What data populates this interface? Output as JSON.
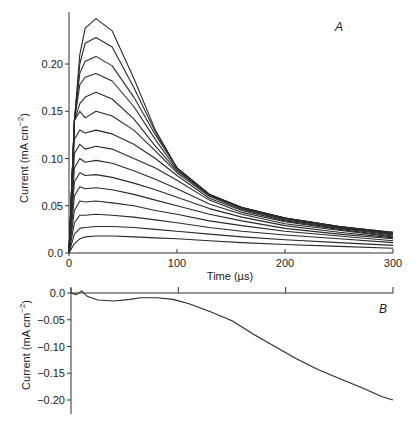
{
  "chart_data": [
    {
      "panel": "A",
      "type": "line",
      "xlabel": "Time (µs)",
      "ylabel": "Current (mA cm⁻²)",
      "xlim": [
        0,
        300
      ],
      "ylim": [
        0,
        0.25
      ],
      "xticks": [
        0,
        100,
        200,
        300
      ],
      "yticks": [
        0.0,
        0.05,
        0.1,
        0.15,
        0.2
      ],
      "ytick_labels": [
        "0.0",
        "0.05",
        "0.10",
        "0.15",
        "0.20"
      ],
      "xtick_labels": [
        "0",
        "100",
        "200",
        "300"
      ],
      "grid": false,
      "x": [
        0,
        5,
        10,
        15,
        25,
        40,
        60,
        80,
        100,
        130,
        160,
        200,
        250,
        300
      ],
      "series": [
        {
          "name": "trace 1",
          "values": [
            0,
            0.14,
            0.21,
            0.238,
            0.248,
            0.235,
            0.185,
            0.13,
            0.09,
            0.062,
            0.048,
            0.037,
            0.028,
            0.022
          ]
        },
        {
          "name": "trace 2",
          "values": [
            0,
            0.14,
            0.2,
            0.222,
            0.228,
            0.218,
            0.175,
            0.128,
            0.09,
            0.062,
            0.048,
            0.037,
            0.028,
            0.022
          ]
        },
        {
          "name": "trace 3",
          "values": [
            0,
            0.14,
            0.19,
            0.203,
            0.208,
            0.198,
            0.165,
            0.125,
            0.09,
            0.062,
            0.048,
            0.037,
            0.028,
            0.021
          ]
        },
        {
          "name": "trace 4",
          "values": [
            0,
            0.14,
            0.178,
            0.186,
            0.19,
            0.182,
            0.155,
            0.12,
            0.088,
            0.062,
            0.048,
            0.037,
            0.028,
            0.021
          ]
        },
        {
          "name": "trace 5",
          "values": [
            0,
            0.14,
            0.158,
            0.165,
            0.17,
            0.163,
            0.142,
            0.113,
            0.087,
            0.061,
            0.047,
            0.036,
            0.027,
            0.02
          ]
        },
        {
          "name": "trace 6",
          "values": [
            0,
            0.14,
            0.15,
            0.143,
            0.15,
            0.145,
            0.13,
            0.108,
            0.085,
            0.06,
            0.046,
            0.035,
            0.027,
            0.02
          ]
        },
        {
          "name": "trace 7",
          "values": [
            0,
            0.12,
            0.13,
            0.127,
            0.13,
            0.126,
            0.115,
            0.1,
            0.082,
            0.058,
            0.045,
            0.034,
            0.026,
            0.019
          ]
        },
        {
          "name": "trace 8",
          "values": [
            0,
            0.105,
            0.115,
            0.11,
            0.113,
            0.11,
            0.1,
            0.09,
            0.077,
            0.056,
            0.043,
            0.033,
            0.025,
            0.018
          ]
        },
        {
          "name": "trace 9",
          "values": [
            0,
            0.09,
            0.1,
            0.096,
            0.098,
            0.095,
            0.087,
            0.078,
            0.068,
            0.052,
            0.041,
            0.031,
            0.024,
            0.017
          ]
        },
        {
          "name": "trace 10",
          "values": [
            0,
            0.075,
            0.085,
            0.082,
            0.083,
            0.08,
            0.074,
            0.067,
            0.059,
            0.047,
            0.038,
            0.029,
            0.022,
            0.016
          ]
        },
        {
          "name": "trace 11",
          "values": [
            0,
            0.06,
            0.07,
            0.068,
            0.069,
            0.067,
            0.062,
            0.056,
            0.05,
            0.041,
            0.034,
            0.026,
            0.02,
            0.015
          ]
        },
        {
          "name": "trace 12",
          "values": [
            0,
            0.045,
            0.055,
            0.054,
            0.055,
            0.053,
            0.05,
            0.045,
            0.041,
            0.034,
            0.029,
            0.023,
            0.018,
            0.013
          ]
        },
        {
          "name": "trace 13",
          "values": [
            0,
            0.032,
            0.04,
            0.04,
            0.041,
            0.04,
            0.038,
            0.035,
            0.032,
            0.027,
            0.023,
            0.019,
            0.015,
            0.011
          ]
        },
        {
          "name": "trace 14",
          "values": [
            0,
            0.02,
            0.026,
            0.027,
            0.028,
            0.028,
            0.027,
            0.025,
            0.023,
            0.02,
            0.017,
            0.014,
            0.011,
            0.008
          ]
        },
        {
          "name": "trace 15",
          "values": [
            0,
            0.01,
            0.015,
            0.017,
            0.018,
            0.018,
            0.017,
            0.016,
            0.015,
            0.013,
            0.011,
            0.009,
            0.007,
            0.005
          ]
        }
      ]
    },
    {
      "panel": "B",
      "type": "line",
      "xlabel": "",
      "ylabel": "Current (mA cm⁻²)",
      "xlim": [
        0,
        300
      ],
      "ylim": [
        -0.22,
        0.01
      ],
      "xticks": [
        0,
        100,
        200,
        300
      ],
      "yticks": [
        0.0,
        -0.05,
        -0.1,
        -0.15,
        -0.2
      ],
      "ytick_labels": [
        "0.0",
        "−0.05",
        "−0.10",
        "−0.15",
        "−0.20"
      ],
      "grid": false,
      "series": [
        {
          "name": "difference",
          "x": [
            0,
            5,
            10,
            15,
            25,
            40,
            55,
            65,
            80,
            95,
            110,
            130,
            150,
            170,
            190,
            210,
            230,
            250,
            270,
            290,
            300
          ],
          "values": [
            0,
            -0.003,
            0.004,
            -0.006,
            -0.013,
            -0.015,
            -0.012,
            -0.009,
            -0.009,
            -0.012,
            -0.02,
            -0.035,
            -0.052,
            -0.077,
            -0.1,
            -0.123,
            -0.143,
            -0.16,
            -0.176,
            -0.194,
            -0.2
          ]
        }
      ]
    }
  ],
  "labels": {
    "panel_a": "A",
    "panel_b": "B",
    "xlabel": "Time (µs)",
    "ylabel_prefix": "Current (mA cm",
    "ylabel_sup": "−2",
    "ylabel_suffix": ")"
  },
  "colors": {
    "line": "#2a2a2a",
    "axis": "#333333",
    "background": "#ffffff"
  }
}
